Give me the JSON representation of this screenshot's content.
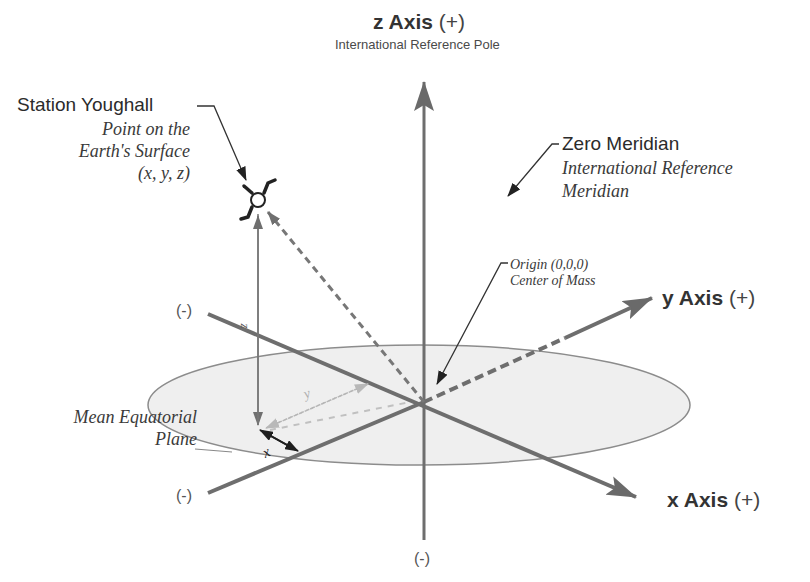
{
  "diagram": {
    "z_axis": {
      "label": "z Axis",
      "sign": "(+)",
      "subtitle": "International Reference Pole",
      "neg": "(-)"
    },
    "y_axis": {
      "label": "y Axis",
      "sign": "(+)",
      "neg": "(-)"
    },
    "x_axis": {
      "label": "x Axis",
      "sign": "(+)",
      "neg": "(-)"
    },
    "station": {
      "name": "Station Youghall",
      "desc_line1": "Point on the",
      "desc_line2": "Earth's Surface",
      "desc_line3": "(x, y, z)"
    },
    "zero_meridian": {
      "title": "Zero Meridian",
      "line1": "International Reference",
      "line2": "Meridian"
    },
    "origin": {
      "line1": "Origin (0,0,0)",
      "line2": "Center of Mass"
    },
    "plane": {
      "line1": "Mean Equatorial",
      "line2": "Plane"
    },
    "components": {
      "z": "z",
      "y": "y",
      "x": "x"
    },
    "colors": {
      "axis": "#6e6e6e",
      "dashed_vector": "#7a7a7a",
      "plane_fill": "#efefef",
      "plane_stroke": "#8a8a8a",
      "component_light": "#b5b5b5",
      "leader": "#333333"
    }
  }
}
